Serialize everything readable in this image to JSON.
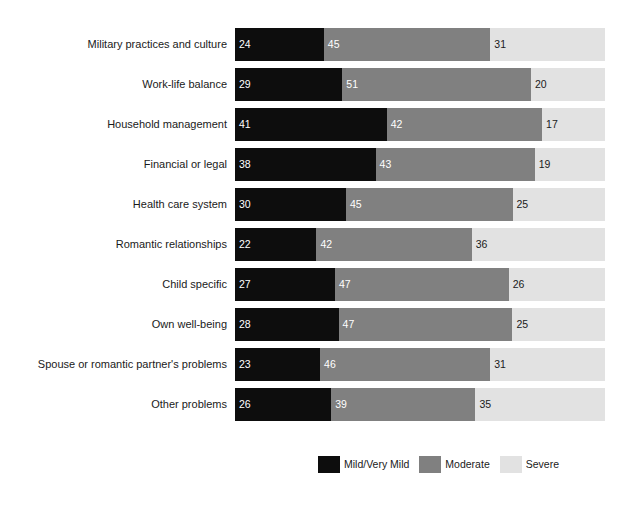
{
  "chart_data": {
    "type": "bar",
    "orientation": "horizontal",
    "stacked": true,
    "normalized_percent": true,
    "title": "",
    "subtitle": "",
    "xlabel": "",
    "ylabel": "",
    "xlim": [
      0,
      100
    ],
    "grid": false,
    "legend_position": "bottom-center",
    "categories": [
      "Military practices and culture",
      "Work-life balance",
      "Household management",
      "Financial or legal",
      "Health care system",
      "Romantic relationships",
      "Child specific",
      "Own well-being",
      "Spouse or romantic partner's problems",
      "Other problems"
    ],
    "series": [
      {
        "name": "Mild/Very Mild",
        "color": "#0d0d0d",
        "values": [
          24,
          29,
          41,
          38,
          30,
          22,
          27,
          28,
          23,
          26
        ]
      },
      {
        "name": "Moderate",
        "color": "#808080",
        "values": [
          45,
          51,
          42,
          43,
          45,
          42,
          47,
          47,
          46,
          39
        ]
      },
      {
        "name": "Severe",
        "color": "#e2e2e2",
        "values": [
          31,
          20,
          17,
          19,
          25,
          36,
          26,
          25,
          31,
          35
        ]
      }
    ]
  },
  "legend": {
    "items": [
      {
        "label": "Mild/Very Mild",
        "color": "#0d0d0d"
      },
      {
        "label": "Moderate",
        "color": "#808080"
      },
      {
        "label": "Severe",
        "color": "#e2e2e2"
      }
    ]
  }
}
